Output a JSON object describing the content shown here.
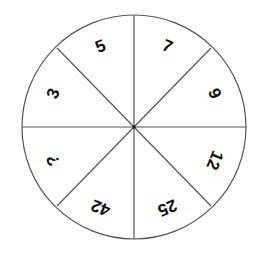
{
  "puzzle": {
    "type": "number-wheel",
    "center": [
      134,
      127
    ],
    "radius": 112,
    "line_color": "#555555",
    "text_color": "#111111",
    "background": "#ffffff",
    "segments": [
      {
        "position": "top-right",
        "label": "7",
        "angle_deg": 22.5
      },
      {
        "position": "right-upper",
        "label": "9",
        "angle_deg": 67.5
      },
      {
        "position": "right-lower",
        "label": "12",
        "angle_deg": 112.5
      },
      {
        "position": "bottom-right",
        "label": "25",
        "angle_deg": 157.5
      },
      {
        "position": "bottom-left",
        "label": "42",
        "angle_deg": 202.5
      },
      {
        "position": "left-lower",
        "label": "?",
        "angle_deg": 247.5
      },
      {
        "position": "left-upper",
        "label": "3",
        "angle_deg": 292.5
      },
      {
        "position": "top-left",
        "label": "5",
        "angle_deg": 337.5
      }
    ]
  }
}
